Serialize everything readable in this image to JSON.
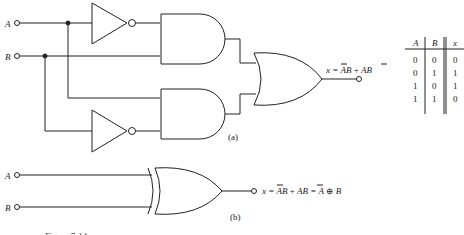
{
  "figure_a": {
    "label": "(a)",
    "inputs": [
      "A",
      "B"
    ],
    "output_expr": {
      "prefix": "x = ",
      "t1_bar": "A",
      "t1_rest": "B",
      "plus": " + ",
      "t2_a": "A",
      "t2_bar": "B"
    }
  },
  "truth_table": {
    "headers": [
      "A",
      "B",
      "x"
    ],
    "rows": [
      [
        "0",
        "0",
        "0"
      ],
      [
        "0",
        "1",
        "1"
      ],
      [
        "1",
        "0",
        "1"
      ],
      [
        "1",
        "1",
        "0"
      ]
    ]
  },
  "figure_b": {
    "label": "(b)",
    "inputs": [
      "A",
      "B"
    ],
    "output_expr": {
      "prefix": "x = ",
      "t1_bar": "A",
      "t1_rest": "B",
      "plus": " + ",
      "t2_a": "A",
      "t2_bar": "B",
      "eq": " = A ⊕ B"
    }
  },
  "caption": "Figure 7-14"
}
